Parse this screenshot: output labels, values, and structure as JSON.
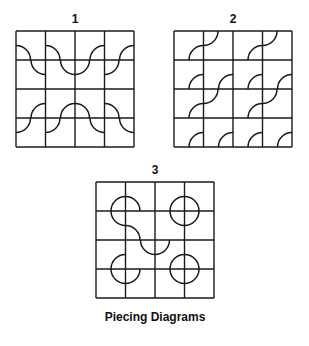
{
  "caption": "Piecing Diagrams",
  "diagrams": [
    {
      "label": "1",
      "rows": 4,
      "cols": 4,
      "arcs": [
        [
          "bl",
          "bl",
          "br",
          "br"
        ],
        [
          "tr",
          "tr",
          "tl",
          "tl"
        ],
        [
          "br",
          "br",
          "bl",
          "bl"
        ],
        [
          "tl",
          "tl",
          "tr",
          "tr"
        ]
      ]
    },
    {
      "label": "2",
      "rows": 4,
      "cols": 4,
      "arcs": [
        [
          "br",
          "tl",
          "br",
          "tl"
        ],
        [
          "br",
          "br",
          "br",
          "br"
        ],
        [
          "br",
          "tl",
          "br",
          "tl"
        ],
        [
          "br",
          "br",
          "br",
          "br"
        ]
      ]
    },
    {
      "label": "3",
      "rows": 4,
      "cols": 4,
      "arcs": [
        [
          [
            "br"
          ],
          [
            "bl"
          ],
          [
            "br"
          ],
          [
            "bl"
          ]
        ],
        [
          [
            "tr"
          ],
          [
            "bl"
          ],
          [
            "tr"
          ],
          [
            "tl"
          ]
        ],
        [
          [
            "br"
          ],
          [
            "tr"
          ],
          [
            "br",
            "tl"
          ],
          [
            "bl"
          ]
        ],
        [
          [
            "tr"
          ],
          [
            "tl"
          ],
          [
            "tr"
          ],
          [
            "tl"
          ]
        ]
      ]
    }
  ]
}
